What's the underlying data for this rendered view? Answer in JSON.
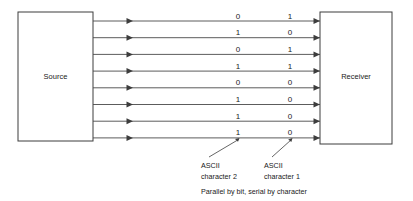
{
  "diagram": {
    "source_box": {
      "label": "Source"
    },
    "receiver_box": {
      "label": "Receiver"
    },
    "caption": "Parallel by bit, serial by character",
    "annotations": [
      {
        "line1": "ASCII",
        "line2": "character 2"
      },
      {
        "line1": "ASCII",
        "line2": "character 1"
      }
    ],
    "bit_rows": [
      {
        "char2": "0",
        "char1": "1"
      },
      {
        "char2": "1",
        "char1": "0"
      },
      {
        "char2": "0",
        "char1": "1"
      },
      {
        "char2": "1",
        "char1": "1"
      },
      {
        "char2": "0",
        "char1": "0"
      },
      {
        "char2": "1",
        "char1": "0"
      },
      {
        "char2": "1",
        "char1": "0"
      },
      {
        "char2": "1",
        "char1": "0"
      }
    ],
    "colors": {
      "background": "#ffffff",
      "stroke": "#3d3d3d",
      "wire": "#4a4a4a",
      "text": "#1a1a1a"
    },
    "geometry": {
      "source_x": 18,
      "source_y": 12,
      "source_w": 75,
      "source_h": 129,
      "receiver_x": 320,
      "receiver_y": 12,
      "receiver_w": 72,
      "receiver_h": 132,
      "wire_first_y": 21,
      "wire_spacing": 16.7,
      "wire_count": 8,
      "mid_arrow_x": 130,
      "col_char2_x": 238,
      "col_char1_x": 290
    }
  }
}
